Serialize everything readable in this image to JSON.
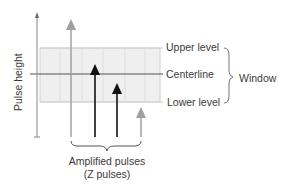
{
  "diagram": {
    "y_axis_label": "Pulse height",
    "levels": {
      "upper": "Upper level",
      "center": "Centerline",
      "lower": "Lower level"
    },
    "window_label": "Window",
    "caption": {
      "line1": "Amplified pulses",
      "line2": "(Z pulses)"
    },
    "pulses": [
      {
        "color": "gray",
        "height": "above upper level"
      },
      {
        "color": "black",
        "height": "at centerline"
      },
      {
        "color": "black",
        "height": "within window below centerline"
      },
      {
        "color": "gray",
        "height": "below lower level"
      }
    ],
    "colors": {
      "window_fill": "#efefef",
      "window_border": "#c8c8c8",
      "axis": "#777777",
      "in_window_pulse": "#111111",
      "out_window_pulse": "#9a9a9a"
    }
  }
}
